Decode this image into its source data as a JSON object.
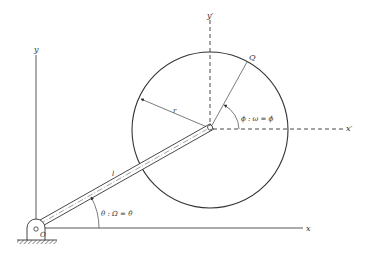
{
  "diagram": {
    "type": "mechanism-kinematics",
    "colors": {
      "line": "#333333",
      "background": "#ffffff"
    },
    "labels": {
      "y_axis": "y",
      "x_axis": "x",
      "y_prime_axis": "y′",
      "x_prime_axis": "x′",
      "point_q": "Q",
      "radius": "r",
      "link_length": "l",
      "pivot": "O",
      "theta_relation": "θ : Ω = θ̇",
      "phi_relation": "ϕ : ω = ϕ̇"
    },
    "elements": {
      "fixed_frame": {
        "origin": "O",
        "axes": [
          "x",
          "y"
        ]
      },
      "rotating_link": {
        "length_label": "l",
        "angle_label": "θ",
        "angular_velocity": "Ω = θ̇"
      },
      "disk": {
        "radius_label": "r",
        "point": "Q",
        "angle_label": "ϕ",
        "angular_velocity": "ω = ϕ̇",
        "local_axes": [
          "x′",
          "y′"
        ]
      }
    }
  }
}
